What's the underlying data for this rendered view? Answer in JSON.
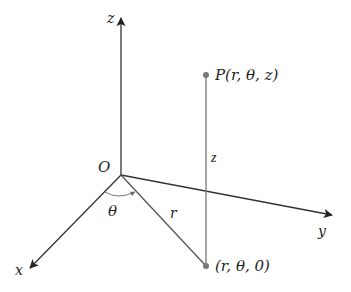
{
  "diagram": {
    "axes": {
      "z_label": "z",
      "x_label": "x",
      "y_label": "y"
    },
    "origin_label": "O",
    "point_p_label": "P(r, θ, z)",
    "point_base_label": "(r, θ, 0)",
    "radius_label": "r",
    "height_label": "z",
    "angle_label": "θ",
    "colors": {
      "axis": "#333333",
      "point": "#777777",
      "background": "#ffffff"
    }
  }
}
